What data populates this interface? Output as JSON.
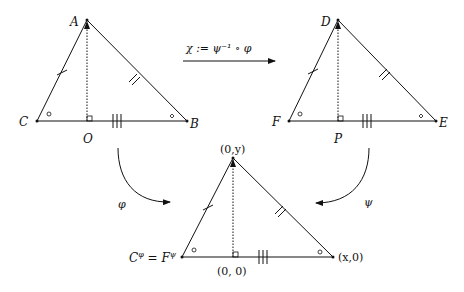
{
  "diagram": {
    "top_arrow_label": "χ := ψ⁻¹ ∘ φ",
    "left_arrow_label": "φ",
    "right_arrow_label": "ψ",
    "triangle_left": {
      "apex": "A",
      "left": "C",
      "foot": "O",
      "right": "B"
    },
    "triangle_right": {
      "apex": "D",
      "left": "F",
      "foot": "P",
      "right": "E"
    },
    "triangle_bottom": {
      "apex": "(0,y)",
      "left": "C",
      "left_sup1": "φ",
      "equals": " = ",
      "left2": "F",
      "left_sup2": "ψ",
      "foot": "(0, 0)",
      "right": "(x,0)"
    },
    "colors": {
      "ink": "#111111",
      "background": "#ffffff"
    }
  }
}
